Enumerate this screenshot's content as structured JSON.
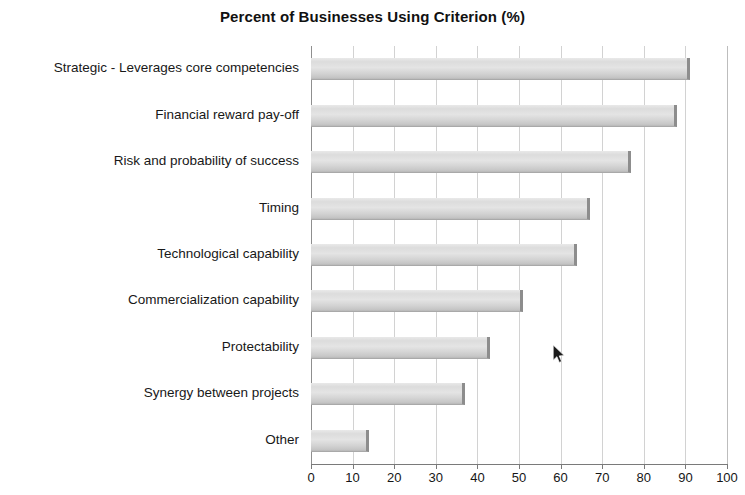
{
  "chart_data": {
    "type": "bar",
    "orientation": "horizontal",
    "title": "Percent of Businesses Using Criterion (%)",
    "xlabel": "",
    "ylabel": "",
    "categories": [
      "Strategic - Leverages core competencies",
      "Financial reward pay-off",
      "Risk and probability of success",
      "Timing",
      "Technological capability",
      "Commercialization capability",
      "Protectability",
      "Synergy between projects",
      "Other"
    ],
    "values": [
      91,
      88,
      77,
      67,
      64,
      51,
      43,
      37,
      14
    ],
    "xlim": [
      0,
      100
    ],
    "xticks": [
      0,
      10,
      20,
      30,
      40,
      50,
      60,
      70,
      80,
      90,
      100
    ],
    "xtick_labels": [
      "0",
      "10",
      "20",
      "30",
      "40",
      "50",
      "60",
      "70",
      "80",
      "90",
      "100"
    ],
    "grid": "vertical",
    "legend": "none",
    "bar_color": "#dcdcdc",
    "bar_edge_color": "#8d8d8d",
    "grid_color": "#d2d2d2",
    "axis_color": "#7a7a7a",
    "text_color": "#181818"
  },
  "cursor": {
    "name": "mouse-pointer",
    "x": 558,
    "y": 352
  }
}
